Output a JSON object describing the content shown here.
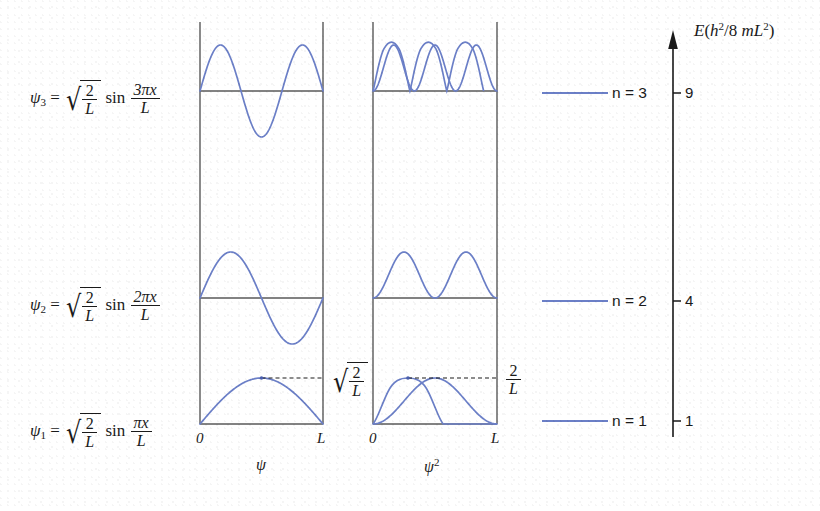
{
  "figure": {
    "background_color": "#ffffff",
    "curve_color": "#6b7fc7",
    "axis_color": "#595959",
    "text_color": "#1a1a1a"
  },
  "equations": {
    "psi3": {
      "lhs_symbol": "ψ",
      "lhs_index": "3",
      "equals": "=",
      "radical_num": "2",
      "radical_den": "L",
      "trig": "sin",
      "arg_num": "3πx",
      "arg_den": "L",
      "plain": "ψ₃ = √(2/L) sin(3πx/L)"
    },
    "psi2": {
      "lhs_symbol": "ψ",
      "lhs_index": "2",
      "equals": "=",
      "radical_num": "2",
      "radical_den": "L",
      "trig": "sin",
      "arg_num": "2πx",
      "arg_den": "L",
      "plain": "ψ₂ = √(2/L) sin(2πx/L)"
    },
    "psi1": {
      "lhs_symbol": "ψ",
      "lhs_index": "1",
      "equals": "=",
      "radical_num": "2",
      "radical_den": "L",
      "trig": "sin",
      "arg_num": "πx",
      "arg_den": "L",
      "plain": "ψ₁ = √(2/L) sin(πx/L)"
    }
  },
  "panels": {
    "psi_panel": {
      "axis_title": "ψ",
      "x_tick_left": "0",
      "x_tick_right": "L",
      "amplitude_label_num": "2",
      "amplitude_label_den": "L",
      "amplitude_label_plain": "√(2/L)",
      "amplitude_has_radical": true
    },
    "psi_squared_panel": {
      "axis_title": "ψ²",
      "axis_title_base": "ψ",
      "axis_title_exp": "2",
      "x_tick_left": "0",
      "x_tick_right": "L",
      "amplitude_label_num": "2",
      "amplitude_label_den": "L",
      "amplitude_label_plain": "2/L",
      "amplitude_has_radical": false
    }
  },
  "energy_axis": {
    "title_prefix": "E",
    "title_open": "(",
    "title_h": "h",
    "title_h_exp": "2",
    "title_slash": "/8",
    "title_m": "m",
    "title_L": "L",
    "title_L_exp": "2",
    "title_close": ")",
    "title_plain": "E(h²/8 mL²)",
    "levels": [
      {
        "n_label": "n = 3",
        "n_value": "3",
        "energy_tick": "9"
      },
      {
        "n_label": "n = 2",
        "n_value": "2",
        "energy_tick": "4"
      },
      {
        "n_label": "n = 1",
        "n_value": "1",
        "energy_tick": "1"
      }
    ]
  },
  "chart_data": {
    "type": "line",
    "xlabel": "x",
    "x_tick_labels": [
      "0",
      "L"
    ],
    "xlim": [
      0,
      1
    ],
    "panels": [
      {
        "name": "psi",
        "ylabel": "ψ",
        "amplitude_annotation": "√(2/L)",
        "series": [
          {
            "name": "ψ₃",
            "n": 3,
            "formula": "sqrt(2/L)*sin(3*pi*x/L)",
            "nodes_interior": 2,
            "peaks": 3,
            "amplitude": 1
          },
          {
            "name": "ψ₂",
            "n": 2,
            "formula": "sqrt(2/L)*sin(2*pi*x/L)",
            "nodes_interior": 1,
            "peaks": 2,
            "amplitude": 1
          },
          {
            "name": "ψ₁",
            "n": 1,
            "formula": "sqrt(2/L)*sin(pi*x/L)",
            "nodes_interior": 0,
            "peaks": 1,
            "amplitude": 1
          }
        ]
      },
      {
        "name": "psi_squared",
        "ylabel": "ψ²",
        "amplitude_annotation": "2/L",
        "series": [
          {
            "name": "ψ₃²",
            "n": 3,
            "formula": "(2/L)*sin^2(3*pi*x/L)",
            "nodes_interior": 2,
            "peaks": 3,
            "amplitude": 1
          },
          {
            "name": "ψ₂²",
            "n": 2,
            "formula": "(2/L)*sin^2(2*pi*x/L)",
            "nodes_interior": 1,
            "peaks": 2,
            "amplitude": 1
          },
          {
            "name": "ψ₁²",
            "n": 1,
            "formula": "(2/L)*sin^2(pi*x/L)",
            "nodes_interior": 0,
            "peaks": 1,
            "amplitude": 1
          }
        ]
      }
    ],
    "energy_levels": {
      "ylabel": "E(h²/8 mL²)",
      "n": [
        1,
        2,
        3
      ],
      "values": [
        1,
        4,
        9
      ],
      "tick_labels": [
        "1",
        "4",
        "9"
      ]
    }
  }
}
